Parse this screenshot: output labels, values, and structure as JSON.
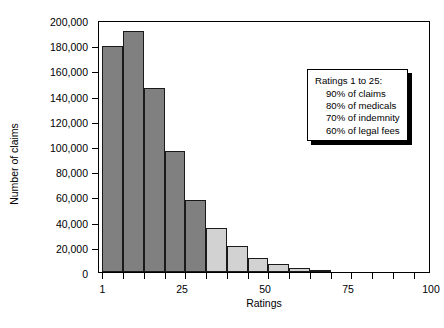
{
  "chart_data": {
    "type": "bar",
    "title": "",
    "xlabel": "Ratings",
    "ylabel": "Number of claims",
    "xlim": [
      0,
      100
    ],
    "ylim": [
      0,
      200000
    ],
    "grid": false,
    "legend_position": "none",
    "y_ticks": [
      0,
      20000,
      40000,
      60000,
      80000,
      100000,
      120000,
      140000,
      160000,
      180000,
      200000
    ],
    "y_tick_labels": [
      "0",
      "20,000",
      "40,000",
      "60,000",
      "80,000",
      "100,000",
      "120,000",
      "140,000",
      "160,000",
      "180,000",
      "200,000"
    ],
    "x_ticks": [
      1,
      25,
      50,
      75,
      100
    ],
    "x_tick_labels": [
      "1",
      "25",
      "50",
      "75",
      "100"
    ],
    "x_minor_tick_step": 6.25,
    "bin_width": 6.25,
    "bars": [
      {
        "x_start": 1.0,
        "x_end": 7.25,
        "value": 179000,
        "color": "#808080"
      },
      {
        "x_start": 7.25,
        "x_end": 13.5,
        "value": 191000,
        "color": "#808080"
      },
      {
        "x_start": 13.5,
        "x_end": 19.75,
        "value": 146000,
        "color": "#808080"
      },
      {
        "x_start": 19.75,
        "x_end": 26.0,
        "value": 96000,
        "color": "#808080"
      },
      {
        "x_start": 26.0,
        "x_end": 32.25,
        "value": 57500,
        "color": "#808080"
      },
      {
        "x_start": 32.25,
        "x_end": 38.5,
        "value": 35000,
        "color": "#d2d2d2"
      },
      {
        "x_start": 38.5,
        "x_end": 44.75,
        "value": 20500,
        "color": "#d2d2d2"
      },
      {
        "x_start": 44.75,
        "x_end": 51.0,
        "value": 11000,
        "color": "#d2d2d2"
      },
      {
        "x_start": 51.0,
        "x_end": 57.25,
        "value": 6500,
        "color": "#d2d2d2"
      },
      {
        "x_start": 57.25,
        "x_end": 63.5,
        "value": 3500,
        "color": "#d2d2d2"
      },
      {
        "x_start": 63.5,
        "x_end": 69.75,
        "value": 1500,
        "color": "#d2d2d2"
      }
    ],
    "annotation": {
      "heading": "Ratings 1 to 25:",
      "lines": [
        "90% of claims",
        "80% of medicals",
        "70% of indemnity",
        "60% of legal fees"
      ]
    }
  },
  "colors": {
    "bar_dark": "#808080",
    "bar_light": "#d2d2d2",
    "axis": "#000000",
    "background": "#ffffff"
  }
}
